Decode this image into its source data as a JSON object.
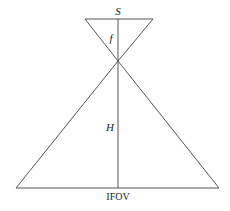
{
  "diagram": {
    "labels": {
      "sensor": "S",
      "focal_length": "f",
      "height": "H",
      "ifov": "IFOV"
    },
    "colors": {
      "line": "#555555",
      "text": "#222222",
      "background": "#ffffff"
    },
    "geometry": {
      "top_line": {
        "x1": 85,
        "y1": 19,
        "x2": 153,
        "y2": 19
      },
      "apex": {
        "x": 118,
        "y": 61
      },
      "bottom_line": {
        "x1": 16,
        "y1": 188,
        "x2": 219,
        "y2": 188
      },
      "axis": {
        "x": 118,
        "y1": 19,
        "y2": 188
      }
    }
  }
}
